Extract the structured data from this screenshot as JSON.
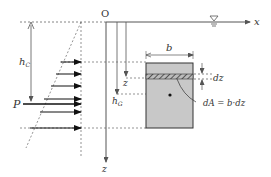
{
  "diagram": {
    "type": "hydrostatic-force-on-submerged-plane",
    "labels": {
      "origin": "O",
      "x_axis": "x",
      "z_axis": "z",
      "depth_center_of_pressure": "h",
      "depth_center_of_pressure_sub": "C",
      "depth_centroid": "h",
      "depth_centroid_sub": "G",
      "force": "P",
      "width": "b",
      "strip_depth": "z",
      "strip_thickness": "dz",
      "area_element": "dA = b·dz"
    },
    "colors": {
      "line": "#555555",
      "plate_fill": "#c8c8c8",
      "plate_border": "#333333",
      "arrow": "#111111",
      "text": "#333333"
    },
    "pressure_arrows": 6
  }
}
